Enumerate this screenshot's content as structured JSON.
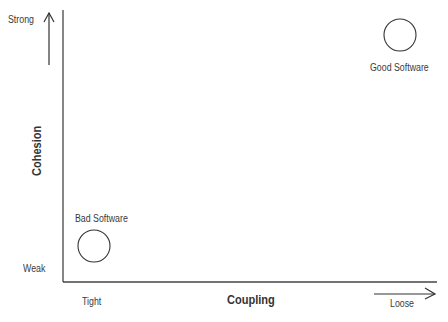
{
  "diagram": {
    "y_axis": {
      "title": "Cohesion",
      "top_label": "Strong",
      "bottom_label": "Weak"
    },
    "x_axis": {
      "title": "Coupling",
      "left_label": "Tight",
      "right_label": "Loose"
    },
    "points": [
      {
        "label": "Bad Software",
        "position": "low cohesion, tight coupling"
      },
      {
        "label": "Good Software",
        "position": "high cohesion, loose coupling"
      }
    ],
    "colors": {
      "line": "#333333",
      "background": "#ffffff"
    }
  }
}
